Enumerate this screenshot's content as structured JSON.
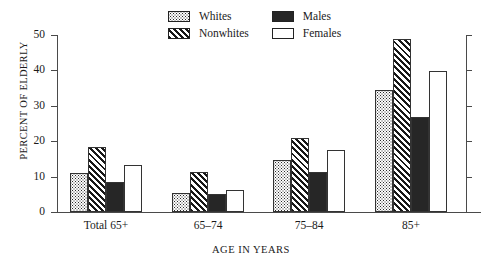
{
  "chart_data": {
    "type": "bar",
    "title": "",
    "xlabel": "AGE IN YEARS",
    "ylabel": "PERCENT OF ELDERLY",
    "categories": [
      "Total 65+",
      "65–74",
      "75–84",
      "85+"
    ],
    "ylim": [
      0,
      50
    ],
    "yticks": [
      "0",
      "10",
      "20",
      "30",
      "40",
      "50"
    ],
    "grid": false,
    "legend_position": "top-center",
    "series": [
      {
        "name": "Whites",
        "pattern": "dots",
        "values": [
          11.0,
          5.5,
          14.6,
          34.5
        ]
      },
      {
        "name": "Nonwhites",
        "pattern": "diagonal-hatch",
        "values": [
          18.5,
          11.3,
          20.8,
          49.0
        ]
      },
      {
        "name": "Males",
        "pattern": "solid-black",
        "values": [
          8.5,
          5.2,
          11.4,
          26.7
        ]
      },
      {
        "name": "Females",
        "pattern": "open-white",
        "values": [
          13.3,
          6.2,
          17.4,
          39.8
        ]
      }
    ]
  },
  "legend": {
    "items": [
      {
        "label": "Whites"
      },
      {
        "label": "Males"
      },
      {
        "label": "Nonwhites"
      },
      {
        "label": "Females"
      }
    ]
  },
  "colors": {
    "axis": "#4a4a4a",
    "bar_outline": "#333333",
    "solid_fill": "#262626",
    "text": "#1a1a1a",
    "background": "#ffffff"
  }
}
